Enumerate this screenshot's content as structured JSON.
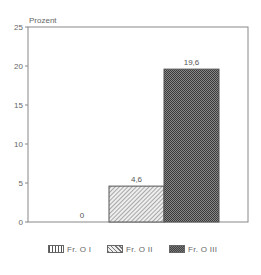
{
  "chart_data": {
    "type": "bar",
    "title": "",
    "ylabel": "Prozent",
    "xlabel": "",
    "categories": [
      "Fr. O I",
      "Fr. O II",
      "Fr. O III"
    ],
    "values": [
      0,
      4.6,
      19.6
    ],
    "value_labels": [
      "0",
      "4,6",
      "19,6"
    ],
    "ylim": [
      0,
      25
    ],
    "yticks": [
      0,
      5,
      10,
      15,
      20,
      25
    ],
    "ytick_labels": [
      "0",
      "5",
      "10",
      "15",
      "20",
      "25"
    ],
    "grid": false,
    "legend_position": "bottom",
    "patterns": [
      "vertical-lines",
      "diagonal-hatch",
      "crosshatch-dense"
    ]
  },
  "legend": {
    "items": [
      {
        "label": "Fr. O I"
      },
      {
        "label": "Fr. O II"
      },
      {
        "label": "Fr. O III"
      }
    ]
  }
}
